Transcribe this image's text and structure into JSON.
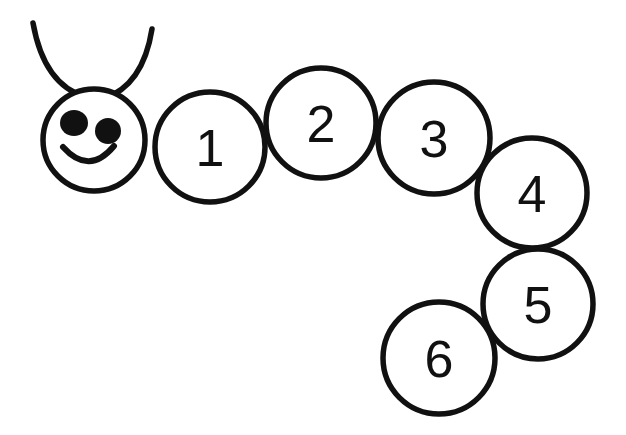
{
  "figure": {
    "background_color": "#ffffff",
    "ink_color": "#111111",
    "stroke_width": 5.5
  },
  "head": {
    "name": "caterpillar-head",
    "cx": 94,
    "cy": 140,
    "r": 51,
    "face": {
      "left_eye": {
        "cx": 74,
        "cy": 123,
        "rx": 14,
        "ry": 13
      },
      "right_eye": {
        "cx": 108,
        "cy": 131,
        "rx": 13,
        "ry": 13
      },
      "smile_path": "M 63 147 Q 89 176 114 146"
    },
    "antennae": [
      {
        "name": "left-antenna",
        "path": "M 33 23 Q 44 85 86 97"
      },
      {
        "name": "right-antenna",
        "path": "M 152 29 Q 143 86 103 99"
      }
    ]
  },
  "body_segments": [
    {
      "label": "1",
      "cx": 210,
      "cy": 147,
      "r": 55,
      "font_size": 52
    },
    {
      "label": "2",
      "cx": 321,
      "cy": 123,
      "r": 55,
      "font_size": 52
    },
    {
      "label": "3",
      "cx": 434,
      "cy": 138,
      "r": 56,
      "font_size": 52
    },
    {
      "label": "4",
      "cx": 532,
      "cy": 193,
      "r": 55,
      "font_size": 52
    },
    {
      "label": "5",
      "cx": 538,
      "cy": 304,
      "r": 55,
      "font_size": 52
    },
    {
      "label": "6",
      "cx": 439,
      "cy": 358,
      "r": 56,
      "font_size": 52
    }
  ],
  "chart_data": {
    "type": "diagram",
    "categories": [
      "1",
      "2",
      "3",
      "4",
      "5",
      "6"
    ],
    "values": [
      1,
      2,
      3,
      4,
      5,
      6
    ]
  }
}
